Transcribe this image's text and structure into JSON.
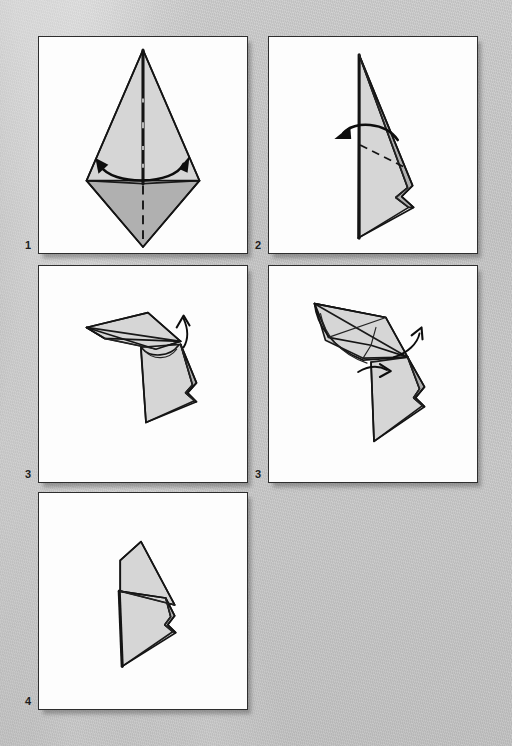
{
  "document": {
    "type": "origami-instruction-diagram",
    "title": "Origami folding sequence",
    "background_color": "#c9c9c9",
    "panel_background": "#fdfdfd",
    "ink_color": "#141414",
    "paper_front_color": "#d6d6d6",
    "paper_back_color": "#b0b0b0",
    "width": 512,
    "height": 746
  },
  "panels": [
    {
      "id": "panel-1",
      "step_label": "1",
      "x": 38,
      "y": 36,
      "w": 210,
      "h": 218,
      "caption": "",
      "description": "Kite base seen flat: tall light-gray triangle on top, darker diamond flap below, vertical mountain crease down the middle, double-headed curved arrow indicating fold in half",
      "annotations": [
        "vertical-dashed-fold-line",
        "double-headed-curved-arrow"
      ]
    },
    {
      "id": "panel-2",
      "step_label": "2",
      "x": 268,
      "y": 36,
      "w": 210,
      "h": 218,
      "caption": "",
      "description": "Narrow folded form standing on a vertical spine with a long slanted edge; dashed fold line across the lower middle and a curved arrow sweeping to the left",
      "annotations": [
        "diagonal-dashed-fold-line",
        "curved-arrow-left"
      ]
    },
    {
      "id": "panel-3",
      "step_label": "3",
      "x": 38,
      "y": 265,
      "w": 210,
      "h": 218,
      "caption": "",
      "description": "Three-dimensional view: a flat wing panel projects to the upper left while the body hangs below; a curved arrow points up at the right edge",
      "annotations": [
        "curved-arrow-up-right"
      ]
    },
    {
      "id": "panel-4",
      "step_label": "3",
      "x": 268,
      "y": 265,
      "w": 210,
      "h": 218,
      "caption": "",
      "description": "Similar three-dimensional view rotated, with the upper flap opening outward; two arrows, one pointing up-right and one pointing right along the lower crease",
      "annotations": [
        "curved-arrow-up-right",
        "curved-arrow-right",
        "creases"
      ]
    },
    {
      "id": "panel-5",
      "step_label": "4",
      "x": 38,
      "y": 492,
      "w": 210,
      "h": 218,
      "caption": "",
      "description": "Finished form: a rounded head-like flap folded over at the top with the tapered body pointing down",
      "annotations": []
    }
  ]
}
